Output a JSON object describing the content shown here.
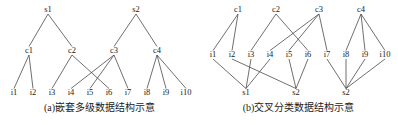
{
  "figure": {
    "width": 398,
    "height": 125,
    "stroke_color": "#4a4a4a",
    "text_color": "#1b1b1b",
    "background": "#ffffff"
  },
  "panel_a": {
    "caption": "(a)嵌套多级数据结构示意",
    "levels": {
      "s_row": [
        {
          "label": "s1",
          "x": 48,
          "y": 12
        },
        {
          "label": "s2",
          "x": 136,
          "y": 12
        }
      ],
      "c_row": [
        {
          "label": "c1",
          "x": 29,
          "y": 53
        },
        {
          "label": "c2",
          "x": 72,
          "y": 53
        },
        {
          "label": "c3",
          "x": 114,
          "y": 53
        },
        {
          "label": "c4",
          "x": 157,
          "y": 53
        }
      ],
      "i_row": [
        {
          "label": "i1",
          "x": 14,
          "y": 95
        },
        {
          "label": "i2",
          "x": 33,
          "y": 95
        },
        {
          "label": "i3",
          "x": 52,
          "y": 95
        },
        {
          "label": "i4",
          "x": 71,
          "y": 95
        },
        {
          "label": "i5",
          "x": 90,
          "y": 95
        },
        {
          "label": "i6",
          "x": 109,
          "y": 95
        },
        {
          "label": "i7",
          "x": 128,
          "y": 95
        },
        {
          "label": "i8",
          "x": 147,
          "y": 95
        },
        {
          "label": "i9",
          "x": 166,
          "y": 95
        },
        {
          "label": "i10",
          "x": 186,
          "y": 95
        }
      ]
    },
    "edges_s_to_c": [
      {
        "from": "s1",
        "to": "c1"
      },
      {
        "from": "s1",
        "to": "c2"
      },
      {
        "from": "s2",
        "to": "c3"
      },
      {
        "from": "s2",
        "to": "c4"
      }
    ],
    "edges_c_to_i": [
      {
        "from": "c1",
        "to": "i1"
      },
      {
        "from": "c1",
        "to": "i2"
      },
      {
        "from": "c2",
        "to": "i3"
      },
      {
        "from": "c2",
        "to": "i6"
      },
      {
        "from": "c3",
        "to": "i4"
      },
      {
        "from": "c3",
        "to": "i5"
      },
      {
        "from": "c3",
        "to": "i7"
      },
      {
        "from": "c4",
        "to": "i8"
      },
      {
        "from": "c4",
        "to": "i9"
      },
      {
        "from": "c4",
        "to": "i10"
      }
    ]
  },
  "panel_b": {
    "caption": "(b)交叉分类数据结构示意",
    "levels": {
      "c_row": [
        {
          "label": "c1",
          "x": 39,
          "y": 12
        },
        {
          "label": "c2",
          "x": 77,
          "y": 12
        },
        {
          "label": "c3",
          "x": 120,
          "y": 12
        },
        {
          "label": "c4",
          "x": 162,
          "y": 12
        }
      ],
      "i_row": [
        {
          "label": "i1",
          "x": 14,
          "y": 57
        },
        {
          "label": "i2",
          "x": 33,
          "y": 57
        },
        {
          "label": "i3",
          "x": 52,
          "y": 57
        },
        {
          "label": "i4",
          "x": 71,
          "y": 57
        },
        {
          "label": "i5",
          "x": 90,
          "y": 57
        },
        {
          "label": "i6",
          "x": 109,
          "y": 57
        },
        {
          "label": "i7",
          "x": 128,
          "y": 57
        },
        {
          "label": "i8",
          "x": 147,
          "y": 57
        },
        {
          "label": "i9",
          "x": 166,
          "y": 57
        },
        {
          "label": "i10",
          "x": 186,
          "y": 57
        }
      ],
      "s_row": [
        {
          "label": "s1",
          "x": 47,
          "y": 95
        },
        {
          "label": "s2",
          "x": 97,
          "y": 95
        },
        {
          "label": "s2",
          "x": 147,
          "y": 95
        }
      ]
    },
    "edges_c_to_i": [
      {
        "from": "c1",
        "to": "i1"
      },
      {
        "from": "c1",
        "to": "i2"
      },
      {
        "from": "c2",
        "to": "i3"
      },
      {
        "from": "c2",
        "to": "i6"
      },
      {
        "from": "c3",
        "to": "i4"
      },
      {
        "from": "c3",
        "to": "i5"
      },
      {
        "from": "c3",
        "to": "i7"
      },
      {
        "from": "c4",
        "to": "i8"
      },
      {
        "from": "c4",
        "to": "i9"
      },
      {
        "from": "c4",
        "to": "i10"
      }
    ],
    "edges_i_to_s": [
      {
        "from": "i1",
        "to": "s1"
      },
      {
        "from": "i2",
        "to": "s2"
      },
      {
        "from": "i3",
        "to": "s1"
      },
      {
        "from": "i4",
        "to": "s1"
      },
      {
        "from": "i5",
        "to": "s2"
      },
      {
        "from": "i6",
        "to": "s2"
      },
      {
        "from": "i7",
        "to": "s3"
      },
      {
        "from": "i8",
        "to": "s3"
      },
      {
        "from": "i9",
        "to": "s3"
      },
      {
        "from": "i10",
        "to": "s3"
      }
    ]
  }
}
